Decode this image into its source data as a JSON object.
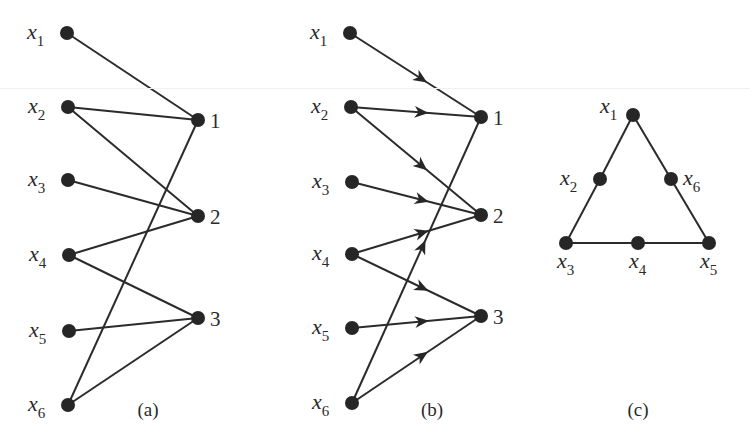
{
  "figure": {
    "panels": [
      {
        "id": "a",
        "caption": "(a)",
        "caption_pos": [
          148,
          416
        ],
        "directed": false,
        "nodes": [
          {
            "id": "x1",
            "label": "x",
            "sub": "1",
            "pos": [
              67,
              33
            ],
            "label_side": "left"
          },
          {
            "id": "x2",
            "label": "x",
            "sub": "2",
            "pos": [
              68,
              107
            ],
            "label_side": "left"
          },
          {
            "id": "x3",
            "label": "x",
            "sub": "3",
            "pos": [
              68,
              180
            ],
            "label_side": "left"
          },
          {
            "id": "x4",
            "label": "x",
            "sub": "4",
            "pos": [
              69,
              255
            ],
            "label_side": "left"
          },
          {
            "id": "x5",
            "label": "x",
            "sub": "5",
            "pos": [
              69,
              331
            ],
            "label_side": "left"
          },
          {
            "id": "x6",
            "label": "x",
            "sub": "6",
            "pos": [
              68,
              405
            ],
            "label_side": "left"
          },
          {
            "id": "1",
            "label": "1",
            "pos": [
              198,
              120
            ],
            "label_side": "right"
          },
          {
            "id": "2",
            "label": "2",
            "pos": [
              198,
              216
            ],
            "label_side": "right"
          },
          {
            "id": "3",
            "label": "3",
            "pos": [
              198,
              318
            ],
            "label_side": "right"
          }
        ],
        "edges": [
          [
            "x1",
            "1"
          ],
          [
            "x2",
            "1"
          ],
          [
            "x2",
            "2"
          ],
          [
            "x3",
            "2"
          ],
          [
            "x4",
            "2"
          ],
          [
            "x4",
            "3"
          ],
          [
            "x5",
            "3"
          ],
          [
            "x6",
            "3"
          ],
          [
            "x6",
            "1"
          ]
        ]
      },
      {
        "id": "b",
        "caption": "(b)",
        "caption_pos": [
          432,
          416
        ],
        "directed": true,
        "nodes": [
          {
            "id": "x1",
            "label": "x",
            "sub": "1",
            "pos": [
              350,
              33
            ],
            "label_side": "left"
          },
          {
            "id": "x2",
            "label": "x",
            "sub": "2",
            "pos": [
              351,
              107
            ],
            "label_side": "left"
          },
          {
            "id": "x3",
            "label": "x",
            "sub": "3",
            "pos": [
              352,
              182
            ],
            "label_side": "left"
          },
          {
            "id": "x4",
            "label": "x",
            "sub": "4",
            "pos": [
              352,
              254
            ],
            "label_side": "left"
          },
          {
            "id": "x5",
            "label": "x",
            "sub": "5",
            "pos": [
              352,
              328
            ],
            "label_side": "left"
          },
          {
            "id": "x6",
            "label": "x",
            "sub": "6",
            "pos": [
              352,
              403
            ],
            "label_side": "left"
          },
          {
            "id": "1",
            "label": "1",
            "pos": [
              481,
              117
            ],
            "label_side": "right"
          },
          {
            "id": "2",
            "label": "2",
            "pos": [
              481,
              215
            ],
            "label_side": "right"
          },
          {
            "id": "3",
            "label": "3",
            "pos": [
              481,
              316
            ],
            "label_side": "right"
          }
        ],
        "edges": [
          [
            "x1",
            "1"
          ],
          [
            "x2",
            "1"
          ],
          [
            "x2",
            "2"
          ],
          [
            "x3",
            "2"
          ],
          [
            "x4",
            "2"
          ],
          [
            "x4",
            "3"
          ],
          [
            "x5",
            "3"
          ],
          [
            "x6",
            "3"
          ],
          [
            "x6",
            "1"
          ]
        ],
        "arrow_fraction": 0.55
      },
      {
        "id": "c",
        "caption": "(c)",
        "caption_pos": [
          638,
          416
        ],
        "directed": false,
        "nodes": [
          {
            "id": "x1",
            "label": "x",
            "sub": "1",
            "pos": [
              633,
              115
            ],
            "label_side": "upper-left"
          },
          {
            "id": "x2",
            "label": "x",
            "sub": "2",
            "pos": [
              600,
              179
            ],
            "label_side": "left"
          },
          {
            "id": "x6",
            "label": "x",
            "sub": "6",
            "pos": [
              671,
              179
            ],
            "label_side": "right"
          },
          {
            "id": "x3",
            "label": "x",
            "sub": "3",
            "pos": [
              566,
              243
            ],
            "label_side": "below"
          },
          {
            "id": "x4",
            "label": "x",
            "sub": "4",
            "pos": [
              638,
              243
            ],
            "label_side": "below"
          },
          {
            "id": "x5",
            "label": "x",
            "sub": "5",
            "pos": [
              709,
              243
            ],
            "label_side": "below"
          }
        ],
        "edges": [
          [
            "x1",
            "x2"
          ],
          [
            "x2",
            "x3"
          ],
          [
            "x3",
            "x4"
          ],
          [
            "x4",
            "x5"
          ],
          [
            "x5",
            "x6"
          ],
          [
            "x6",
            "x1"
          ]
        ]
      }
    ],
    "colors": {
      "ink": "#262626",
      "background": "#ffffff"
    }
  }
}
